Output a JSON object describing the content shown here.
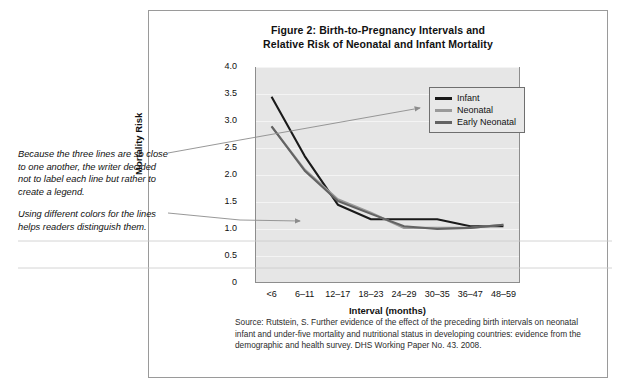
{
  "figure": {
    "title_line_1": "Figure 2: Birth-to-Pregnancy Intervals and",
    "title_line_2": "Relative Risk of Neonatal and Infant Mortality",
    "source_note": "Source: Rutstein, S. Further evidence of the effect of the preceding birth intervals on neonatal infant and under-five mortality and nutritional status in developing countries: evidence from the demographic and health survey. DHS Working Paper No. 43. 2008."
  },
  "annotations": [
    {
      "id": "annot-1",
      "text": "Because the three lines are so close to one another, the writer decided not to label each line but rather to create a legend."
    },
    {
      "id": "annot-2",
      "text": "Using different colors for the lines helps readers distinguish them."
    }
  ],
  "colors": {
    "infant": "#1a1a1a",
    "neonatal": "#9a9a9a",
    "early_neonatal": "#636363",
    "plot_background": "#e6e6e6",
    "panel_border": "#9a9a9a",
    "leader_line": "#8c8c8c"
  },
  "chart_data": {
    "type": "line",
    "title": "Figure 2: Birth-to-Pregnancy Intervals and Relative Risk of Neonatal and Infant Mortality",
    "xlabel": "Interval (months)",
    "ylabel": "Mortality Risk",
    "categories": [
      "<6",
      "6–11",
      "12–17",
      "18–23",
      "24–29",
      "30–35",
      "36–47",
      "48–59"
    ],
    "ylim": [
      0,
      4.0
    ],
    "yticks": [
      "0",
      "0.5",
      "1.0",
      "1.5",
      "2.0",
      "2.5",
      "3.0",
      "3.5",
      "4.0"
    ],
    "ytick_values": [
      0,
      0.5,
      1.0,
      1.5,
      2.0,
      2.5,
      3.0,
      3.5,
      4.0
    ],
    "grid": true,
    "legend_position": "upper right",
    "series": [
      {
        "name": "Infant",
        "color": "#1a1a1a",
        "values": [
          3.45,
          2.35,
          1.45,
          1.18,
          1.18,
          1.18,
          1.05,
          1.05
        ]
      },
      {
        "name": "Neonatal",
        "color": "#9a9a9a",
        "values": [
          2.9,
          2.1,
          1.55,
          1.3,
          1.02,
          1.02,
          1.02,
          1.08
        ]
      },
      {
        "name": "Early Neonatal",
        "color": "#636363",
        "values": [
          2.9,
          2.08,
          1.52,
          1.28,
          1.05,
          1.0,
          1.02,
          1.08
        ]
      }
    ]
  }
}
